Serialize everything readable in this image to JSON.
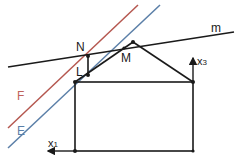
{
  "diagram": {
    "colors": {
      "black": "#1a1a1a",
      "plane_F": "#b5574f",
      "plane_E": "#5b7fa8",
      "label_F": "#c0625a",
      "label_E": "#5b7fa8"
    },
    "labels": {
      "N": "N",
      "L": "L",
      "M": "M",
      "m": "m",
      "F": "F",
      "E": "E",
      "x3": "x",
      "x3_sub": "3",
      "x1": "x",
      "x1_sub": "1"
    },
    "lines": {
      "m": {
        "x1": 8,
        "y1": 67,
        "x2": 234,
        "y2": 32
      },
      "F": {
        "x1": 8,
        "y1": 128,
        "x2": 138,
        "y2": 5
      },
      "E": {
        "x1": 8,
        "y1": 148,
        "x2": 160,
        "y2": 5
      }
    },
    "points": {
      "N": {
        "x": 88,
        "y": 56
      },
      "L": {
        "x": 88,
        "y": 75
      },
      "M": {
        "x": 124,
        "y": 48
      },
      "apex": {
        "x": 133,
        "y": 42
      }
    },
    "house": {
      "left": 75,
      "right": 193,
      "top": 82,
      "bottom": 151
    }
  }
}
